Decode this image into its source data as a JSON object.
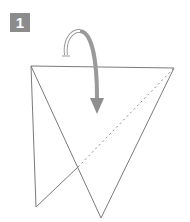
{
  "step": {
    "number": "1",
    "badge_color": "#8c8c8c"
  },
  "diagram": {
    "line_color": "#7a7a7a",
    "arrow_color": "#9a9a9a",
    "elements": [
      "paper-outline",
      "valley-fold-dashed-line",
      "fold-arrow"
    ]
  }
}
